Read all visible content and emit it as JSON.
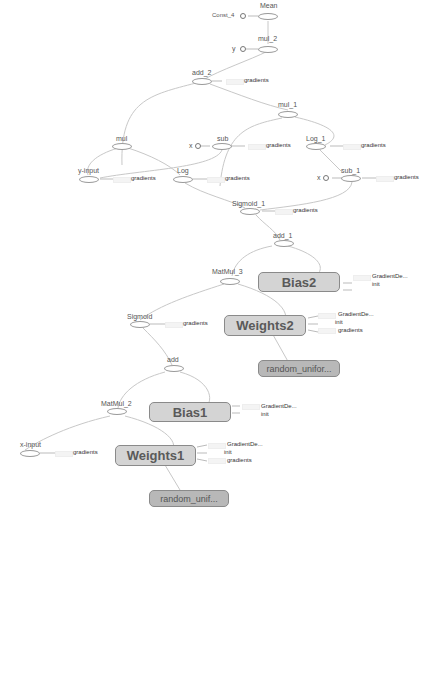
{
  "graph": {
    "title": "Computation graph (TensorBoard-style)",
    "colors": {
      "edge": "#c8c8c8",
      "op_border": "#9a9a9a",
      "variable_fill": "#d4d4d4",
      "initializer_fill": "#b8b8b8",
      "text": "#555555"
    },
    "nodes": {
      "mean": "Mean",
      "const4": "Const_4",
      "mul2": "mul_2",
      "y": "y",
      "add2": "add_2",
      "mul1": "mul_1",
      "mul": "mul",
      "sub": "sub",
      "x_sub": "x",
      "log1": "Log_1",
      "yinput": "y-input",
      "log": "Log",
      "sub1": "sub_1",
      "x_sub1": "x",
      "sigmoid1": "Sigmoid_1",
      "add1": "add_1",
      "matmul3": "MatMul_3",
      "bias2": "Bias2",
      "sigmoid": "Sigmoid",
      "weights2": "Weights2",
      "random_uniform2": "random_unifor...",
      "add": "add",
      "matmul2": "MatMul_2",
      "bias1": "Bias1",
      "xinput": "x-input",
      "weights1": "Weights1",
      "random_uniform1": "random_unif..."
    },
    "aux": {
      "gradients": "gradients",
      "gradient_descent": "GradientDe...",
      "init": "init"
    }
  }
}
